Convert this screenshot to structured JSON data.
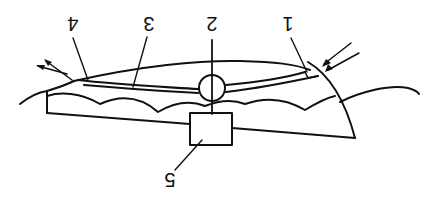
{
  "diagram": {
    "orientation": "rotated-180",
    "labels": [
      {
        "id": "1",
        "text": "1"
      },
      {
        "id": "2",
        "text": "2"
      },
      {
        "id": "3",
        "text": "3"
      },
      {
        "id": "4",
        "text": "4"
      },
      {
        "id": "5",
        "text": "5"
      }
    ],
    "colors": {
      "line": "#111111",
      "background": "#ffffff"
    }
  }
}
